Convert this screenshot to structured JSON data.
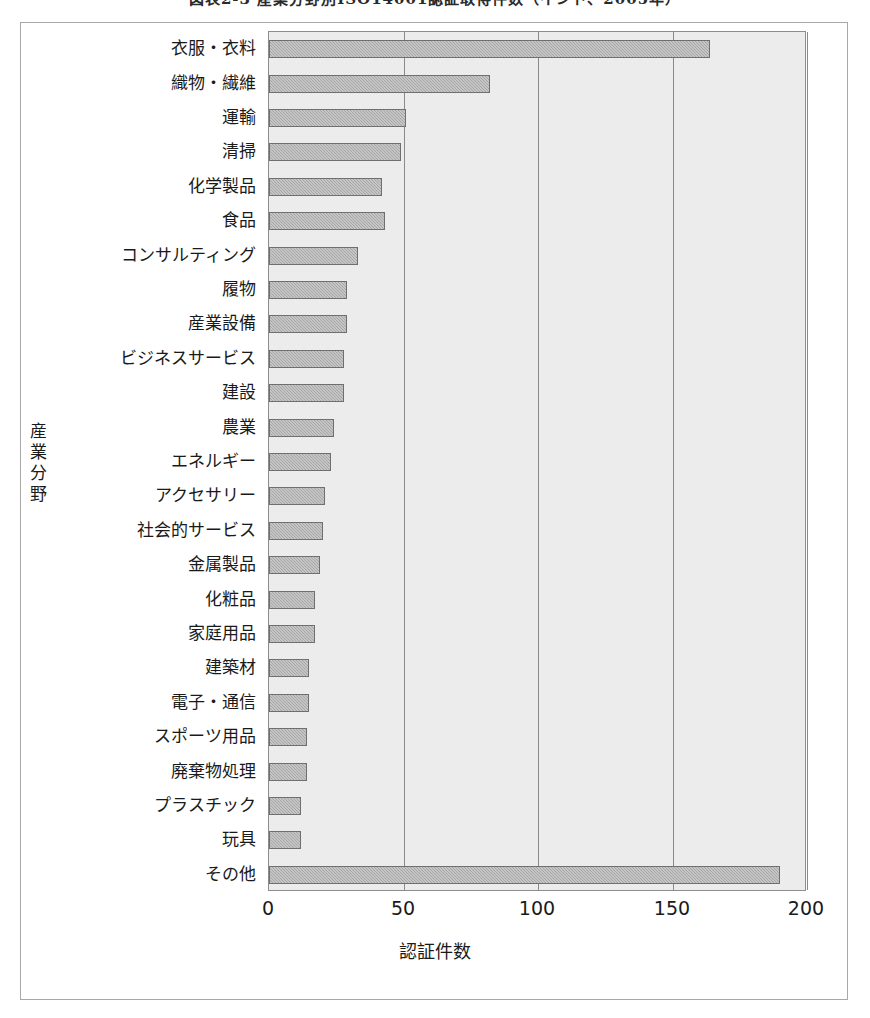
{
  "figure": {
    "caption": "図表2-3 産業分野別ISO14001認証取得件数（インド、2005年）",
    "caption_clipped": true
  },
  "chart_data": {
    "type": "bar",
    "orientation": "horizontal",
    "title": "",
    "xlabel": "認証件数",
    "ylabel": "産業分野",
    "ylabel_chars": [
      "産",
      "業",
      "分",
      "野"
    ],
    "xlim": [
      0,
      200
    ],
    "xticks": [
      0,
      50,
      100,
      150,
      200
    ],
    "xtick_labels": [
      "0",
      "50",
      "100",
      "150",
      "200"
    ],
    "grid": "vertical",
    "legend": "none",
    "bar_color": "#a6a6a6",
    "bar_border_color": "#6f6f6f",
    "plot_background": "#ececec",
    "categories": [
      "衣服・衣料",
      "織物・繊維",
      "運輸",
      "清掃",
      "化学製品",
      "食品",
      "コンサルティング",
      "履物",
      "産業設備",
      "ビジネスサービス",
      "建設",
      "農業",
      "エネルギー",
      "アクセサリー",
      "社会的サービス",
      "金属製品",
      "化粧品",
      "家庭用品",
      "建築材",
      "電子・通信",
      "スポーツ用品",
      "廃棄物処理",
      "プラスチック",
      "玩具",
      "その他"
    ],
    "values": [
      164,
      82,
      51,
      49,
      42,
      43,
      33,
      29,
      29,
      28,
      28,
      24,
      23,
      21,
      20,
      19,
      17,
      17,
      15,
      15,
      14,
      14,
      12,
      12,
      190
    ]
  }
}
